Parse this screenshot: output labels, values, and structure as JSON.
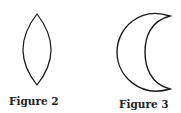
{
  "figures": [
    {
      "id": "figure-2",
      "caption": "Figure 2",
      "shape": "lens"
    },
    {
      "id": "figure-3",
      "caption": "Figure 3",
      "shape": "crescent"
    }
  ],
  "colors": {
    "stroke": "#1a1a1a",
    "background": "#ffffff",
    "text": "#222222"
  }
}
